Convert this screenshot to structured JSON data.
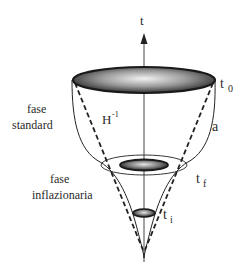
{
  "diagram": {
    "type": "inflationary-universe-cone",
    "axis": {
      "label": "t",
      "icon": "arrow-up-icon"
    },
    "labels": {
      "t0": {
        "base": "t",
        "sub": "0"
      },
      "tf": {
        "base": "t",
        "sub": "f"
      },
      "ti": {
        "base": "t",
        "sub": "i"
      },
      "hubble": {
        "base": "H",
        "sup": "-1"
      },
      "scale_factor": "a"
    },
    "phases": {
      "standard": {
        "line1": "fase",
        "line2": "standard"
      },
      "inflationary": {
        "line1": "fase",
        "line2": "inflazionaria"
      }
    },
    "colors": {
      "stroke": "#222222",
      "disk_dark": "#3a3a3a",
      "disk_light": "#e8e8e8"
    }
  }
}
